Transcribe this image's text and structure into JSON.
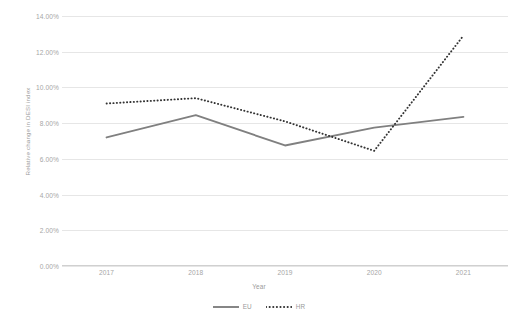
{
  "chart_data": {
    "type": "line",
    "title": "",
    "xlabel": "Year",
    "ylabel": "Relative change in DESI index",
    "categories": [
      "2017",
      "2018",
      "2019",
      "2020",
      "2021"
    ],
    "x": [
      2017,
      2018,
      2019,
      2020,
      2021
    ],
    "ylim": [
      0,
      14
    ],
    "ytick_labels": [
      "0.00%",
      "2.00%",
      "4.00%",
      "6.00%",
      "8.00%",
      "10.00%",
      "12.00%",
      "14.00%"
    ],
    "ytick_values": [
      0,
      2,
      4,
      6,
      8,
      10,
      12,
      14
    ],
    "grid": true,
    "legend_position": "bottom",
    "series": [
      {
        "name": "EU",
        "style": "solid",
        "color": "#808080",
        "values": [
          7.2,
          8.45,
          6.75,
          7.75,
          8.35
        ]
      },
      {
        "name": "HR",
        "style": "dotted",
        "color": "#333333",
        "values": [
          9.1,
          9.4,
          8.1,
          6.45,
          12.9
        ]
      }
    ]
  },
  "colors": {
    "eu_line": "#808080",
    "hr_line": "#333333",
    "gridline": "#e6e6e6",
    "axis": "#d0d0d0",
    "tick_text": "#a6a6a6",
    "title_text": "#9a9a9a",
    "background": "#ffffff"
  }
}
